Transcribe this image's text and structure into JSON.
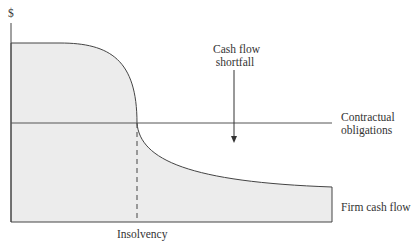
{
  "diagram": {
    "y_axis_label": "$",
    "annotation": {
      "line1": "Cash flow",
      "line2": "shortfall"
    },
    "contractual_label": {
      "line1": "Contractual",
      "line2": "obligations"
    },
    "firm_cash_flow_label": "Firm cash flow",
    "insolvency_label": "Insolvency",
    "colors": {
      "fill": "#ececec",
      "stroke": "#444444"
    }
  }
}
